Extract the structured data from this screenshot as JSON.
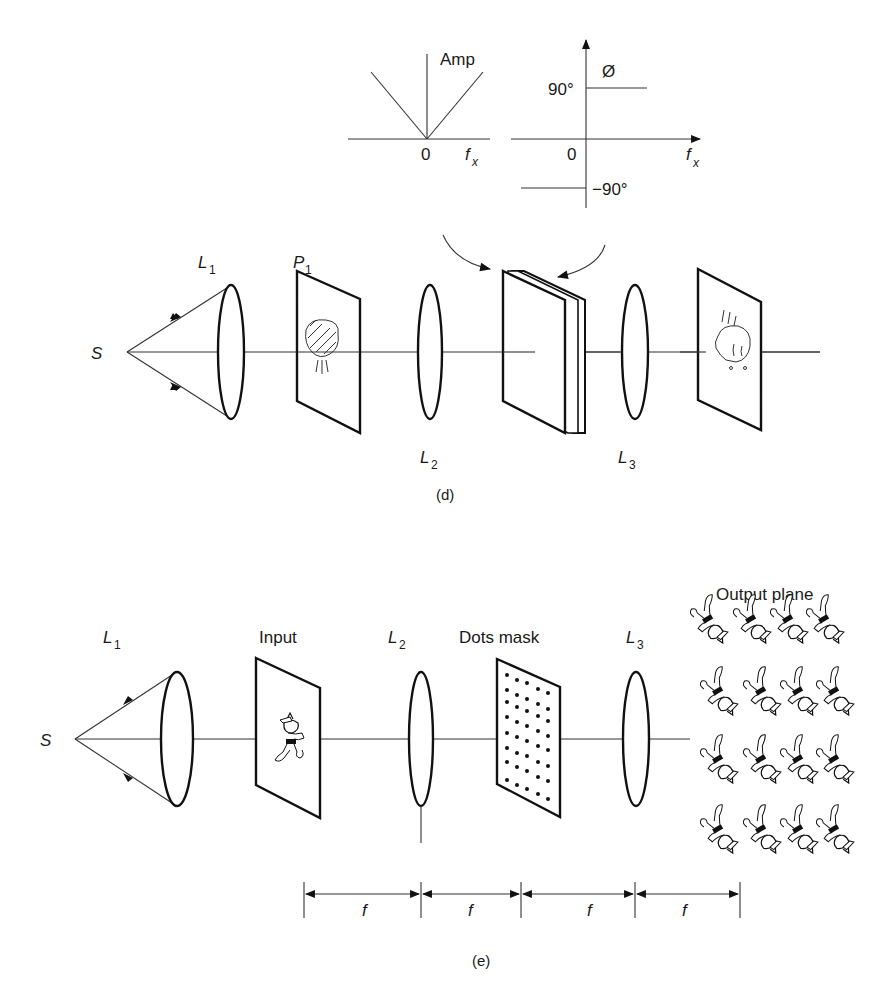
{
  "figure_d": {
    "amplitude_plot": {
      "axis_label": "Amp",
      "origin_label": "0",
      "x_label": "f",
      "x_label_sub": "x"
    },
    "phase_plot": {
      "axis_label": "Ø",
      "origin_label": "0",
      "upper_level": "90°",
      "lower_level": "−90°",
      "x_label": "f",
      "x_label_sub": "x"
    },
    "source_label": "S",
    "lens1": {
      "label": "L",
      "sub": "1"
    },
    "input_plane": {
      "label": "P",
      "sub": "1"
    },
    "lens2": {
      "label": "L",
      "sub": "2"
    },
    "lens3": {
      "label": "L",
      "sub": "3"
    },
    "caption": "(d)"
  },
  "figure_e": {
    "source_label": "S",
    "lens1": {
      "label": "L",
      "sub": "1"
    },
    "input_label": "Input",
    "lens2": {
      "label": "L",
      "sub": "2"
    },
    "mask_label": "Dots mask",
    "lens3": {
      "label": "L",
      "sub": "3"
    },
    "output_label": "Output plane",
    "output_grid": {
      "rows": 4,
      "cols": 4
    },
    "spacings": [
      "f",
      "f",
      "f",
      "f"
    ],
    "caption": "(e)"
  }
}
